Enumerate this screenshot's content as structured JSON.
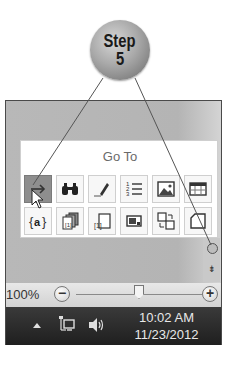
{
  "callout": {
    "line1": "Step",
    "line2": "5"
  },
  "popup": {
    "title": "Go To",
    "icons_row1": [
      {
        "name": "go-to-arrow-icon",
        "active": true
      },
      {
        "name": "find-binoculars-icon",
        "active": false
      },
      {
        "name": "pencil-icon",
        "active": false
      },
      {
        "name": "numbered-list-icon",
        "active": false
      },
      {
        "name": "picture-icon",
        "active": false
      },
      {
        "name": "table-icon",
        "active": false
      }
    ],
    "icons_row2": [
      {
        "name": "field-code-icon",
        "active": false
      },
      {
        "name": "stacked-pages-icon",
        "active": false
      },
      {
        "name": "page-bracket-icon",
        "active": false
      },
      {
        "name": "text-box-icon",
        "active": false
      },
      {
        "name": "swap-objects-icon",
        "active": false
      },
      {
        "name": "page-icon",
        "active": false
      }
    ]
  },
  "zoom": {
    "level": "100%",
    "minus": "−",
    "plus": "+"
  },
  "scroll": {
    "down_glyph": "⇟"
  },
  "taskbar": {
    "time": "10:02 AM",
    "date": "11/23/2012"
  },
  "colors": {
    "panel": "#b6b6b6",
    "active_icon": "#8e8e8e",
    "taskbar": "#2a2a2a"
  }
}
